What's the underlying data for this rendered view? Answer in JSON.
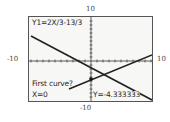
{
  "graph": {
    "equation_label": "Y1=2X/3-13/3",
    "prompt": "First curve?",
    "x_readout": "X=0",
    "y_readout": "Y=-4.333333",
    "axis_labels": {
      "top": "10",
      "bottom": "-10",
      "left": "-10",
      "right": "10"
    },
    "colors": {
      "background": "#f7f7f5",
      "ink": "#2a2a2a",
      "frame": "#555555"
    }
  }
}
